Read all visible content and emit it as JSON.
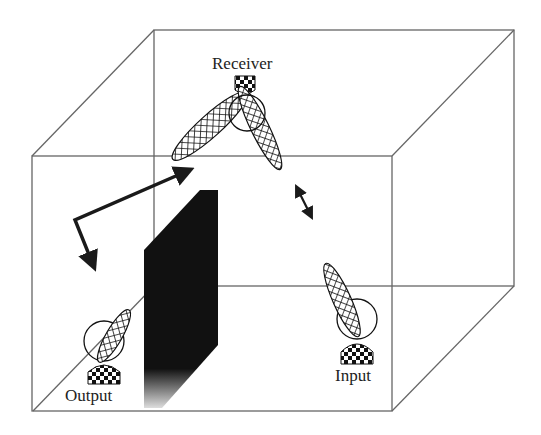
{
  "diagram": {
    "title": "",
    "labels": {
      "receiver": "Receiver",
      "output": "Output",
      "input": "Input"
    },
    "colors": {
      "background": "#ffffff",
      "cube_edge": "#666666",
      "board": "#111111",
      "ink": "#1a1a1a"
    },
    "nodes": [
      {
        "id": "receiver",
        "label": "Receiver",
        "type": "antenna-with-beam-lobes"
      },
      {
        "id": "output",
        "label": "Output",
        "type": "antenna-with-beam-lobe"
      },
      {
        "id": "input",
        "label": "Input",
        "type": "antenna-with-beam-lobe"
      },
      {
        "id": "board",
        "label": "",
        "type": "obstacle-panel"
      }
    ],
    "arrows": [
      {
        "id": "reflection-path",
        "type": "bent-arrow"
      },
      {
        "id": "movement",
        "type": "double-headed-arrow"
      }
    ]
  }
}
